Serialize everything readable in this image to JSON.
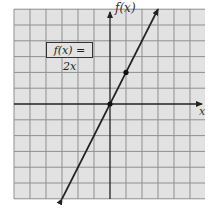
{
  "chart_data": {
    "type": "line",
    "title": "",
    "function_label": "f(x) = 2x",
    "xlabel": "x",
    "ylabel": "f(x)",
    "xlim": [
      -6,
      6
    ],
    "ylim": [
      -6,
      6
    ],
    "grid": true,
    "grid_step": 1,
    "tick_labels": false,
    "series": [
      {
        "name": "f(x) = 2x",
        "x": [
          -3,
          3
        ],
        "y": [
          -6,
          6
        ],
        "arrows": "both"
      }
    ],
    "points": [
      {
        "x": 0,
        "y": 0
      },
      {
        "x": 1,
        "y": 2
      }
    ]
  },
  "colors": {
    "grid_background": "#e2e2e2",
    "grid_lines": "#8a8a8a",
    "axes": "#222222",
    "line": "#222222"
  }
}
